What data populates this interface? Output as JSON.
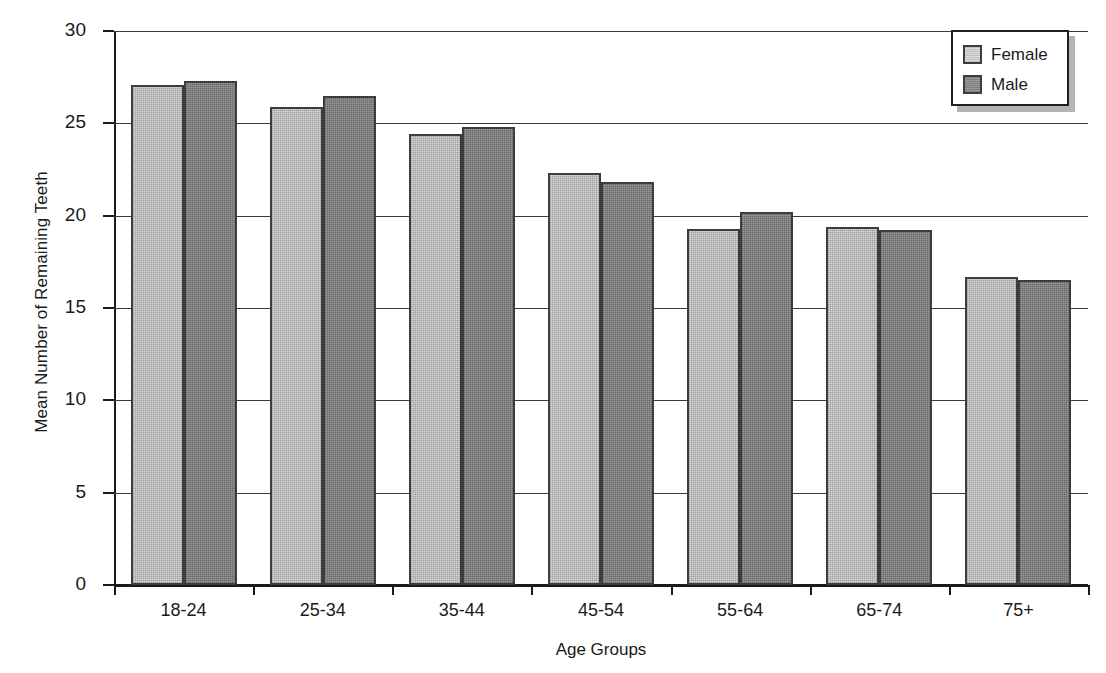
{
  "chart_data": {
    "type": "bar",
    "title": "",
    "xlabel": "Age Groups",
    "ylabel": "Mean Number of Remaining Teeth",
    "categories": [
      "18-24",
      "25-34",
      "35-44",
      "45-54",
      "55-64",
      "65-74",
      "75+"
    ],
    "series": [
      {
        "name": "Female",
        "color": "#d8d8d8",
        "values": [
          27.1,
          25.9,
          24.4,
          22.3,
          19.3,
          19.4,
          16.7
        ]
      },
      {
        "name": "Male",
        "color": "#9a9a9a",
        "values": [
          27.3,
          26.5,
          24.8,
          21.8,
          20.2,
          19.2,
          16.5
        ]
      }
    ],
    "ylim": [
      0,
      30
    ],
    "yticks": [
      "0",
      "5",
      "10",
      "15",
      "20",
      "25",
      "30"
    ],
    "ytick_values": [
      0,
      5,
      10,
      15,
      20,
      25,
      30
    ],
    "grid": "horizontal",
    "legend_position": "top-right",
    "legend_entries": [
      "Female",
      "Male"
    ]
  }
}
